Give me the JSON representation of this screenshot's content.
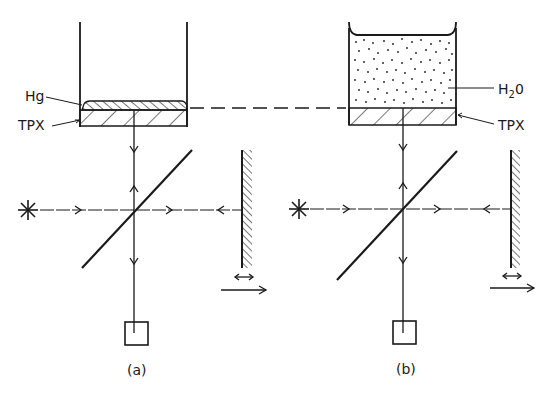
{
  "diagram": {
    "type": "Michelson interferometer setup (two configurations)",
    "colors": {
      "ink": "#1a1a1a",
      "background": "#ffffff"
    },
    "panels": [
      {
        "id": "a",
        "caption": "(a)",
        "labels": {
          "top_layer": "Hg",
          "window": "TPX"
        },
        "components": [
          "container",
          "mercury-layer",
          "tpx-window",
          "light-source",
          "beam-splitter",
          "movable-mirror",
          "detector"
        ]
      },
      {
        "id": "b",
        "caption": "(b)",
        "labels": {
          "medium": "H",
          "medium_sub": "2",
          "medium_suffix": "0",
          "window": "TPX"
        },
        "components": [
          "container",
          "water",
          "tpx-window",
          "light-source",
          "beam-splitter",
          "movable-mirror",
          "detector"
        ]
      }
    ],
    "connector": "dashed line linking Hg/TPX interface in (a) to TPX top surface in (b)"
  }
}
